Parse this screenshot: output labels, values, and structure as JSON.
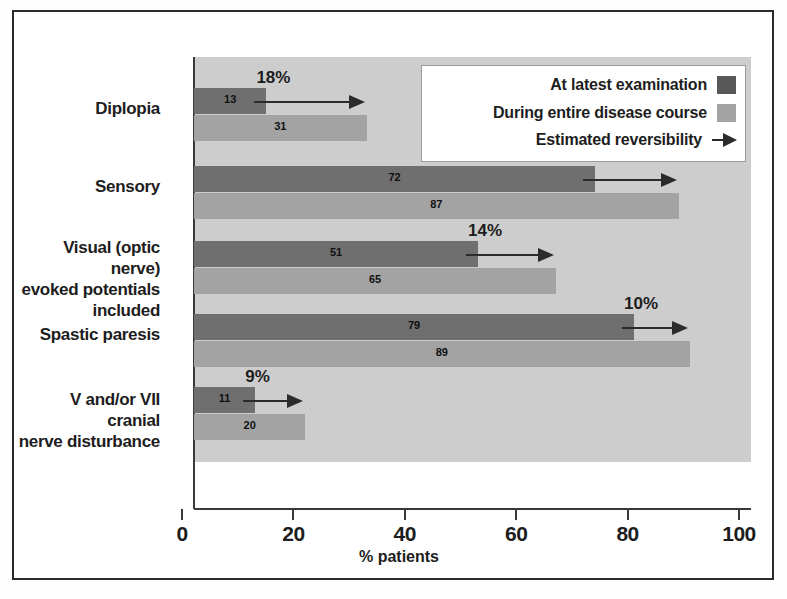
{
  "chart_data": {
    "type": "bar",
    "title": "",
    "xlabel": "% patients",
    "ylabel": "",
    "xlim": [
      0,
      100
    ],
    "xticks": [
      "0",
      "20",
      "40",
      "60",
      "80",
      "100"
    ],
    "grid": false,
    "orientation": "horizontal",
    "legend_position": "top-right",
    "categories": [
      "Diplopia",
      "Sensory",
      "Visual (optic nerve) evoked potentials included",
      "Spastic paresis",
      "V and/or VII cranial nerve disturbance"
    ],
    "series": [
      {
        "name": "At latest examination",
        "color": "#6f6f6f",
        "values": [
          13,
          72,
          51,
          79,
          11
        ]
      },
      {
        "name": "During entire disease course",
        "color": "#a3a3a3",
        "values": [
          31,
          87,
          65,
          89,
          20
        ]
      },
      {
        "name": "Estimated reversibility",
        "color": "#2b2b2b",
        "values": [
          18,
          15,
          14,
          10,
          9
        ],
        "labels": [
          "18%",
          "15%",
          "14%",
          "10%",
          "9%"
        ]
      }
    ]
  },
  "legend": {
    "items": [
      {
        "label": "At latest examination",
        "marker": "dark-swatch"
      },
      {
        "label": "During entire disease course",
        "marker": "light-swatch"
      },
      {
        "label": "Estimated reversibility",
        "marker": "arrow"
      }
    ]
  },
  "axis": {
    "x_title": "% patients",
    "ticks": [
      "0",
      "20",
      "40",
      "60",
      "80",
      "100"
    ]
  },
  "rows": [
    {
      "label_lines": [
        "Diplopia"
      ],
      "dark_value": "13",
      "dark_pct": 13,
      "light_value": "31",
      "light_pct": 31,
      "arrow_label": "18%",
      "arrow_pct": 18
    },
    {
      "label_lines": [
        "Sensory"
      ],
      "dark_value": "72",
      "dark_pct": 72,
      "light_value": "87",
      "light_pct": 87,
      "arrow_label": "15%",
      "arrow_pct": 15
    },
    {
      "label_lines": [
        "Visual (optic nerve)",
        "evoked potentials",
        "included"
      ],
      "dark_value": "51",
      "dark_pct": 51,
      "light_value": "65",
      "light_pct": 65,
      "arrow_label": "14%",
      "arrow_pct": 14
    },
    {
      "label_lines": [
        "Spastic paresis"
      ],
      "dark_value": "79",
      "dark_pct": 79,
      "light_value": "89",
      "light_pct": 89,
      "arrow_label": "10%",
      "arrow_pct": 10
    },
    {
      "label_lines": [
        "V and/or VII cranial",
        "nerve disturbance"
      ],
      "dark_value": "11",
      "dark_pct": 11,
      "light_value": "20",
      "light_pct": 20,
      "arrow_label": "9%",
      "arrow_pct": 9
    }
  ],
  "colors": {
    "dark_bar": "#6f6f6f",
    "light_bar": "#a3a3a3",
    "plot_background": "#cdcdcd",
    "arrow": "#2b2b2b",
    "text": "#1d1d1d"
  }
}
